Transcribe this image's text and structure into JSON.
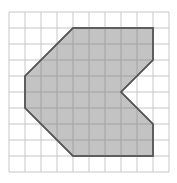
{
  "diagram": {
    "type": "grid-polygon",
    "grid": {
      "cols": 10,
      "rows": 10,
      "origin_x": 9,
      "origin_y": 12,
      "cell_size": 16,
      "line_color": "#c6c6c6"
    },
    "polygon": {
      "fill": "#bcbcbc",
      "stroke": "#555555",
      "vertices": [
        [
          4,
          1
        ],
        [
          9,
          1
        ],
        [
          9,
          3
        ],
        [
          7,
          5
        ],
        [
          9,
          7
        ],
        [
          9,
          9
        ],
        [
          4,
          9
        ],
        [
          1,
          6
        ],
        [
          1,
          4
        ]
      ]
    }
  }
}
